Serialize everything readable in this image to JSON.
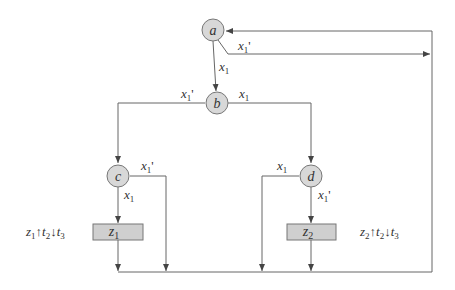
{
  "diagram": {
    "type": "flowchart",
    "colors": {
      "line": "#555555",
      "node_fill": "#d8d8d8",
      "node_stroke": "#777777",
      "box_fill": "#cfcfcf",
      "text": "#333333"
    },
    "nodes": [
      {
        "id": "a",
        "label": "a"
      },
      {
        "id": "b",
        "label": "b"
      },
      {
        "id": "c",
        "label": "c"
      },
      {
        "id": "d",
        "label": "d"
      }
    ],
    "boxes": [
      {
        "id": "z1",
        "label": "z",
        "sub": "1"
      },
      {
        "id": "z2",
        "label": "z",
        "sub": "2"
      }
    ],
    "edge_labels": {
      "a_true": {
        "var": "x",
        "sub": "1",
        "prime": ""
      },
      "a_false": {
        "var": "x",
        "sub": "1",
        "prime": "'"
      },
      "b_false": {
        "var": "x",
        "sub": "1",
        "prime": "'"
      },
      "b_true": {
        "var": "x",
        "sub": "1",
        "prime": ""
      },
      "c_false": {
        "var": "x",
        "sub": "1",
        "prime": "'"
      },
      "c_true": {
        "var": "x",
        "sub": "1",
        "prime": ""
      },
      "d_true": {
        "var": "x",
        "sub": "1",
        "prime": ""
      },
      "d_false": {
        "var": "x",
        "sub": "1",
        "prime": "'"
      }
    },
    "annotations": [
      {
        "id": "z1_note",
        "z": "z",
        "zsub": "1",
        "up": "↑",
        "t2": "t",
        "t2sub": "2",
        "down": "↓",
        "t3": "t",
        "t3sub": "3"
      },
      {
        "id": "z2_note",
        "z": "z",
        "zsub": "2",
        "up": "↑",
        "t2": "t",
        "t2sub": "2",
        "down": "↓",
        "t3": "t",
        "t3sub": "3"
      }
    ]
  }
}
